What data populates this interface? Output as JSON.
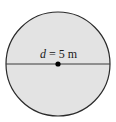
{
  "diagram": {
    "shape": "circle",
    "fill_color": "#e3e3e3",
    "stroke_color": "#2a2a2a",
    "label": {
      "variable": "d",
      "equals": " = 5 m",
      "full_text": "d = 5 m"
    },
    "diameter": {
      "value": 5,
      "unit": "m"
    },
    "center_point": "center-dot"
  }
}
